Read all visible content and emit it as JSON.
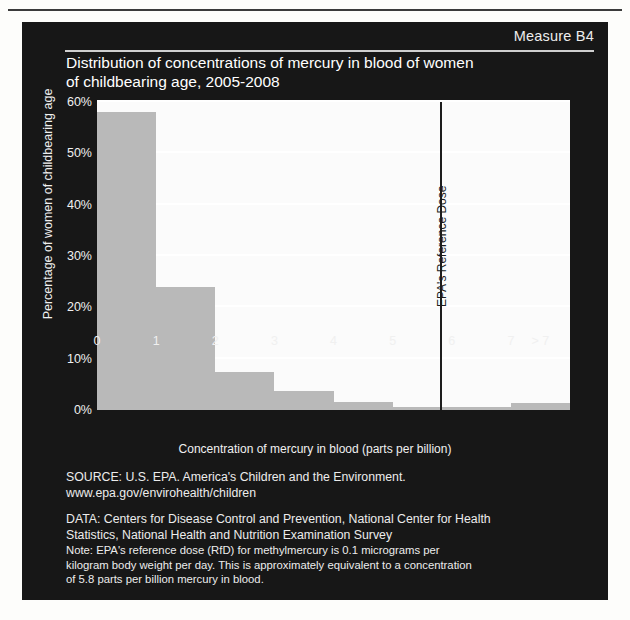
{
  "header": {
    "measure_label": "Measure B4"
  },
  "chart_data": {
    "type": "bar",
    "title": "Distribution of concentrations of mercury in blood of women of childbearing age, 2005-2008",
    "title_lines": [
      "Distribution of concentrations of mercury in blood of women",
      "of childbearing age, 2005-2008"
    ],
    "xlabel": "Concentration of mercury in blood (parts per billion)",
    "ylabel": "Percentage of women of childbearing age",
    "categories": [
      "0-1",
      "1-2",
      "2-3",
      "3-4",
      "4-5",
      "5-6",
      "6-7",
      ">7"
    ],
    "values": [
      58,
      24,
      7.5,
      3.8,
      1.6,
      0.6,
      0.5,
      1.3
    ],
    "bar_color": "#b9b9b9",
    "ylim": [
      0,
      60
    ],
    "xlim": [
      0,
      8
    ],
    "ytick_labels": [
      "0%",
      "10%",
      "20%",
      "30%",
      "40%",
      "50%",
      "60%"
    ],
    "ytick_values": [
      0,
      10,
      20,
      30,
      40,
      50,
      60
    ],
    "xtick_labels": [
      "0",
      "1",
      "2",
      "3",
      "4",
      "5",
      "6",
      "7",
      "> 7"
    ],
    "xtick_values": [
      0,
      1,
      2,
      3,
      4,
      5,
      6,
      7,
      7.5
    ],
    "grid": "horizontal",
    "legend": "none",
    "annotations": [
      {
        "name": "epa-reference-dose",
        "label": "EPA's Reference Dose",
        "x": 5.8,
        "orientation": "vertical-line",
        "color": "#1d1d1d"
      }
    ]
  },
  "footer": {
    "source_lines": [
      "SOURCE: U.S. EPA. America's Children and the Environment.",
      "www.epa.gov/envirohealth/children"
    ],
    "data_lines": [
      "DATA: Centers for Disease Control and Prevention, National Center for Health",
      "Statistics, National Health and Nutrition Examination Survey"
    ],
    "note_lines": [
      "Note: EPA's reference dose (RfD) for methylmercury is 0.1 micrograms per",
      "kilogram body weight per day. This is approximately equivalent to a concentration",
      "of 5.8 parts per billion mercury in blood."
    ]
  }
}
